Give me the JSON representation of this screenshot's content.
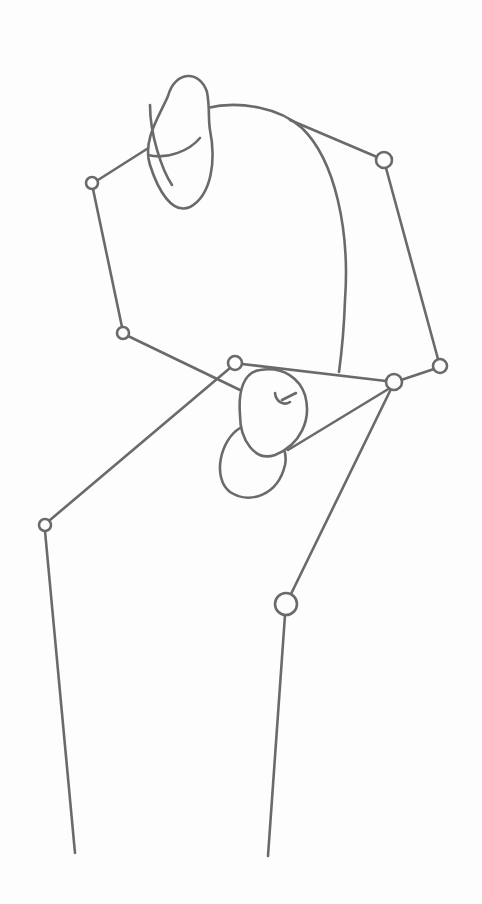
{
  "figure": {
    "line_color": "#6a6a6a",
    "background": "#fdfdfd",
    "joints": {
      "shoulder_left": [
        92,
        183,
        6
      ],
      "elbow_left": [
        123,
        333,
        6
      ],
      "shoulder_right": [
        384,
        160,
        8
      ],
      "elbow_right": [
        440,
        366,
        7
      ],
      "hip_left": [
        235,
        363,
        7
      ],
      "hip_right": [
        394,
        382,
        8
      ],
      "knee_left": [
        45,
        525,
        6
      ],
      "knee_right": [
        286,
        604,
        11
      ]
    },
    "limbs": [
      [
        "shoulder_left",
        "elbow_left"
      ],
      [
        "shoulder_right",
        "elbow_right"
      ],
      [
        "elbow_right",
        "hip_right"
      ],
      [
        "hip_left",
        "hip_right"
      ]
    ]
  }
}
